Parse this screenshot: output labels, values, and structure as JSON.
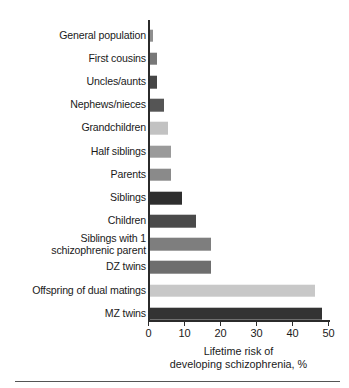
{
  "figure": {
    "background": "#ffffff",
    "axis_color": "#2b2b2b",
    "rule_color": "#555555"
  },
  "chart_data": {
    "type": "bar",
    "orientation": "horizontal",
    "title": "",
    "xlabel_line1": "Lifetime risk of",
    "xlabel_line2": "developing schizophrenia, %",
    "ylabel": "",
    "xlim": [
      0,
      50
    ],
    "ylim": null,
    "grid": false,
    "legend": null,
    "xticks": [
      0,
      10,
      20,
      30,
      40,
      50
    ],
    "xtick_labels": [
      "0",
      "10",
      "20",
      "30",
      "40",
      "50"
    ],
    "categories": [
      "General population",
      "First cousins",
      "Uncles/aunts",
      "Nephews/nieces",
      "Grandchildren",
      "Half siblings",
      "Parents",
      "Siblings",
      "Children",
      "Siblings with 1\nschizophrenic parent",
      "DZ twins",
      "Offspring of dual matings",
      "MZ twins"
    ],
    "values": [
      1,
      2,
      2,
      4,
      5,
      6,
      6,
      9,
      13,
      17,
      17,
      46,
      48
    ],
    "bar_colors": [
      "#8f8f8f",
      "#787878",
      "#464646",
      "#555555",
      "#c2c2c2",
      "#9a9a9a",
      "#8a8a8a",
      "#2e2e2e",
      "#4a4a4a",
      "#7e7e7e",
      "#6e6e6e",
      "#c8c8c8",
      "#333333"
    ]
  }
}
